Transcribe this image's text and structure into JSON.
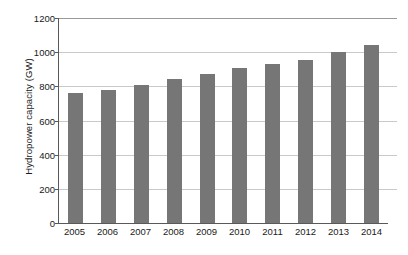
{
  "chart_data": {
    "type": "bar",
    "title": "",
    "subtitle": "",
    "xlabel": "",
    "ylabel": "Hydropower capacity (GW)",
    "categories": [
      "2005",
      "2006",
      "2007",
      "2008",
      "2009",
      "2010",
      "2011",
      "2012",
      "2013",
      "2014"
    ],
    "values": [
      760,
      780,
      810,
      845,
      870,
      905,
      930,
      955,
      1000,
      1040
    ],
    "series": [
      {
        "name": "Hydropower capacity",
        "values": [
          760,
          780,
          810,
          845,
          870,
          905,
          930,
          955,
          1000,
          1040
        ]
      }
    ],
    "ylim": [
      0,
      1200
    ],
    "xlim_categorical": true,
    "y_ticks": [
      0,
      200,
      400,
      600,
      800,
      1000,
      1200
    ],
    "y_tick_labels": [
      "0",
      "200",
      "400",
      "600",
      "800",
      "1000",
      "1200"
    ],
    "grid": true,
    "grid_axis": "y",
    "legend": false,
    "legend_position": "none",
    "units": "GW",
    "bar_color": "#767676",
    "gridline_color": "#c9c9c9",
    "axis_color": "#58595b",
    "background_color": "#ffffff"
  },
  "axes": {
    "y_title": "Hydropower capacity (GW)"
  }
}
